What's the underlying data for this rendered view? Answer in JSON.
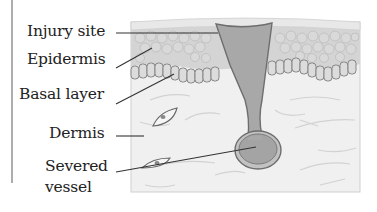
{
  "diagram": {
    "labels": [
      {
        "id": "injury-site",
        "text": "Injury site"
      },
      {
        "id": "epidermis",
        "text": "Epidermis"
      },
      {
        "id": "basal-layer",
        "text": "Basal layer"
      },
      {
        "id": "dermis",
        "text": "Dermis"
      },
      {
        "id": "severed-vessel",
        "line1": "Severed",
        "line2": "vessel"
      }
    ],
    "colors": {
      "surface": "#e6e6e6",
      "epidermis": "#d2d2d2",
      "cell_outline": "#b0b0b0",
      "basal_cell_fill": "#dadada",
      "basal_cell_outline": "#8a8a8a",
      "dermis": "#f0f0f0",
      "wound_fill": "#a8a8a8",
      "wound_outline": "#6e6e6e",
      "leader_line": "#333333",
      "text": "#222222"
    }
  }
}
